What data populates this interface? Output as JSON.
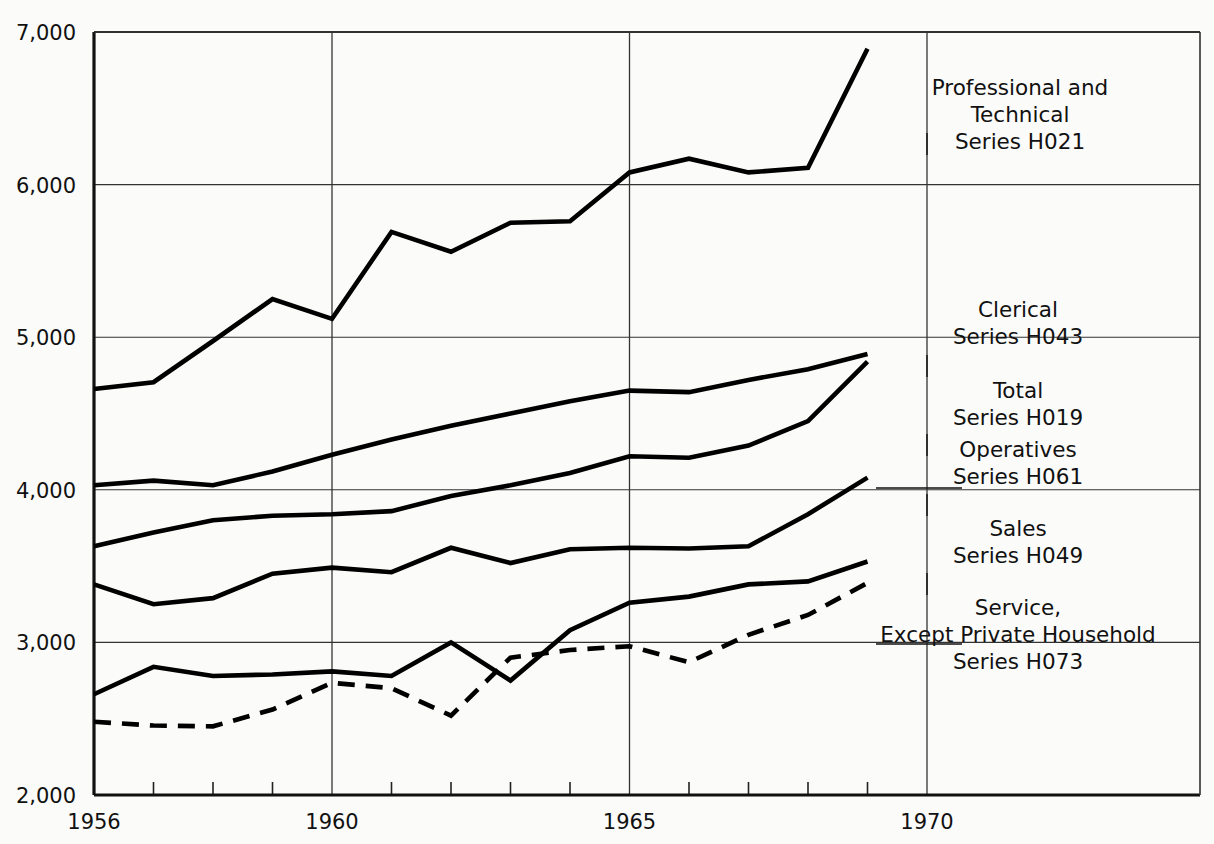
{
  "chart_data": {
    "type": "line",
    "title": "",
    "subtitle": "",
    "xlabel": "",
    "ylabel": "",
    "x": [
      1956,
      1957,
      1958,
      1959,
      1960,
      1961,
      1962,
      1963,
      1964,
      1965,
      1966,
      1967,
      1968,
      1969
    ],
    "xlim": [
      1956,
      1969
    ],
    "ylim": [
      2000,
      7000
    ],
    "ytick_labels": [
      "2,000",
      "3,000",
      "4,000",
      "5,000",
      "6,000",
      "7,000"
    ],
    "ytick_values": [
      2000,
      3000,
      4000,
      5000,
      6000,
      7000
    ],
    "xtick_labels": [
      "1956",
      "1960",
      "1965",
      "1970"
    ],
    "xtick_values": [
      1956,
      1960,
      1965,
      1970
    ],
    "xminor_interval": 1,
    "grid": "major-x-and-y",
    "legend_position": "inline-right-annotations",
    "series": [
      {
        "name": "Professional and Technical",
        "code": "Series H021",
        "style": "solid",
        "color": "#000000",
        "values": [
          4660,
          4705,
          4975,
          5250,
          5120,
          5690,
          5560,
          5750,
          5760,
          6080,
          6170,
          6080,
          6110,
          6890
        ]
      },
      {
        "name": "Clerical",
        "code": "Series H043",
        "style": "solid",
        "color": "#000000",
        "values": [
          4030,
          4060,
          4030,
          4120,
          4230,
          4330,
          4420,
          4500,
          4580,
          4650,
          4640,
          4720,
          4790,
          4890
        ]
      },
      {
        "name": "Total",
        "code": "Series H019",
        "style": "solid",
        "color": "#000000",
        "values": [
          3630,
          3720,
          3800,
          3830,
          3840,
          3860,
          3960,
          4030,
          4110,
          4220,
          4210,
          4290,
          4450,
          4840
        ]
      },
      {
        "name": "Operatives",
        "code": "Series H061",
        "style": "solid",
        "color": "#000000",
        "values": [
          3380,
          3250,
          3290,
          3450,
          3490,
          3460,
          3620,
          3520,
          3610,
          3620,
          3615,
          3630,
          3840,
          4080
        ]
      },
      {
        "name": "Sales",
        "code": "Series H049",
        "style": "solid",
        "color": "#000000",
        "values": [
          2660,
          2840,
          2780,
          2790,
          2810,
          2780,
          3000,
          2750,
          3080,
          3260,
          3300,
          3380,
          3400,
          3530
        ]
      },
      {
        "name": "Service, Except Private Household",
        "code": "Series H073",
        "style": "dashed",
        "color": "#000000",
        "values": [
          2480,
          2455,
          2450,
          2560,
          2735,
          2700,
          2520,
          2900,
          2950,
          2975,
          2870,
          3050,
          3180,
          3390
        ]
      }
    ],
    "annotations": [
      {
        "id": "ann-professional",
        "lines": [
          "Professional and",
          "Technical",
          "Series H021"
        ],
        "x": 1020,
        "y": 95
      },
      {
        "id": "ann-clerical",
        "lines": [
          "Clerical",
          "Series H043"
        ],
        "x": 1018,
        "y": 317
      },
      {
        "id": "ann-total",
        "lines": [
          "Total",
          "Series H019"
        ],
        "x": 1018,
        "y": 398
      },
      {
        "id": "ann-operatives",
        "lines": [
          "Operatives",
          "Series H061"
        ],
        "x": 1018,
        "y": 457
      },
      {
        "id": "ann-sales",
        "lines": [
          "Sales",
          "Series H049"
        ],
        "x": 1018,
        "y": 536
      },
      {
        "id": "ann-service",
        "lines": [
          "Service,",
          "Except Private Household",
          "Series H073"
        ],
        "x": 1018,
        "y": 615
      }
    ]
  },
  "axis": {
    "y_labels": [
      "7,000",
      "6,000",
      "5,000",
      "4,000",
      "3,000",
      "2,000"
    ],
    "x_labels": [
      "1956",
      "1960",
      "1965",
      "1970"
    ]
  }
}
